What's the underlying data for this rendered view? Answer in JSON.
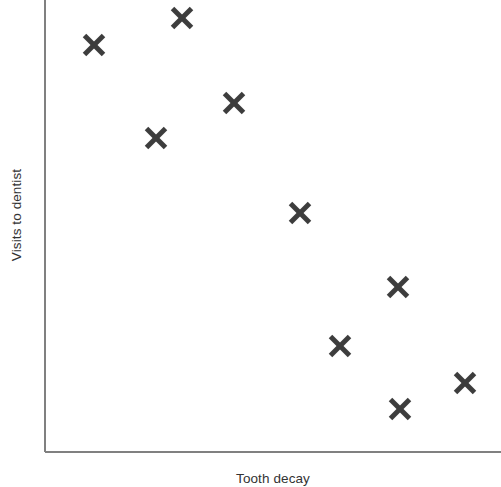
{
  "chart_data": {
    "type": "scatter",
    "title": "",
    "xlabel": "Tooth decay",
    "ylabel": "Visits to dentist",
    "grid": false,
    "legend": null,
    "axis_ticks": false,
    "axis_tick_labels": false,
    "xlim": [
      0,
      10
    ],
    "ylim": [
      0,
      10
    ],
    "marker": "x",
    "marker_color": "#3d3d3d",
    "marker_size_px": 19,
    "marker_stroke_px": 5,
    "axis_color": "#808080",
    "axis_width_px": 2,
    "relationship": "negative correlation",
    "n_points": 10,
    "points": [
      {
        "x": 1.1,
        "y": 9.0
      },
      {
        "x": 3.0,
        "y": 9.6
      },
      {
        "x": 4.1,
        "y": 7.7
      },
      {
        "x": 2.4,
        "y": 7.0
      },
      {
        "x": 5.6,
        "y": 5.3
      },
      {
        "x": 7.7,
        "y": 3.6
      },
      {
        "x": 6.4,
        "y": 2.3
      },
      {
        "x": 9.2,
        "y": 1.5
      },
      {
        "x": 7.8,
        "y": 1.0
      },
      {
        "x": 0,
        "y": 0
      }
    ],
    "pixel_points": [
      {
        "cx": 94,
        "cy": 45
      },
      {
        "cx": 182,
        "cy": 18
      },
      {
        "cx": 234,
        "cy": 103
      },
      {
        "cx": 156,
        "cy": 138
      },
      {
        "cx": 300,
        "cy": 213
      },
      {
        "cx": 398,
        "cy": 287
      },
      {
        "cx": 340,
        "cy": 346
      },
      {
        "cx": 465,
        "cy": 383
      },
      {
        "cx": 400,
        "cy": 409
      }
    ],
    "axes_geometry": {
      "origin_x": 45,
      "origin_y": 452,
      "y_axis_top": 0,
      "x_axis_right": 501
    }
  }
}
